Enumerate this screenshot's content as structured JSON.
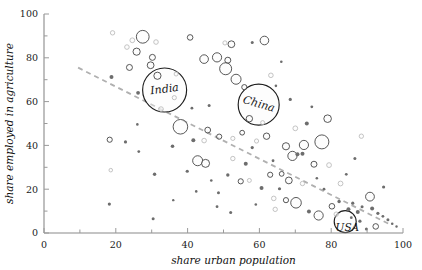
{
  "chart_data": {
    "type": "scatter",
    "title": "",
    "subtitle": "",
    "xlabel": "share urban population",
    "ylabel": "share employed in agriculture",
    "xlim": [
      0,
      100
    ],
    "ylim": [
      0,
      100
    ],
    "xticks": [
      0,
      20,
      40,
      60,
      80,
      100
    ],
    "yticks": [
      0,
      20,
      40,
      60,
      80,
      100
    ],
    "xtick_labels": [
      "0",
      "20",
      "40",
      "60",
      "80",
      "100"
    ],
    "ytick_labels": [
      "0",
      "20",
      "40",
      "60",
      "80",
      "100"
    ],
    "grid": false,
    "legend": null,
    "minor_ticks": true,
    "bubble_encoding": "population (bubble area)",
    "trend": {
      "type": "linear-fit",
      "style": "dashed",
      "color": "#b0b0b0",
      "x_start": 9.5,
      "y_start": 75.5,
      "x_end": 96.5,
      "y_end": 3.8
    },
    "annotations": [
      {
        "label": "India",
        "x": 33.7,
        "y": 65.5,
        "font_size": 11
      },
      {
        "label": "China",
        "x": 59.6,
        "y": 58.8,
        "font_size": 11
      },
      {
        "label": "USA",
        "x": 84.5,
        "y": 2.5,
        "font_size": 10.5
      }
    ],
    "points": [
      {
        "x": 33.6,
        "y": 65.3,
        "r": 22.0,
        "cls": "big",
        "name": "India"
      },
      {
        "x": 59.8,
        "y": 58.6,
        "r": 20.5,
        "cls": "big",
        "name": "China"
      },
      {
        "x": 83.9,
        "y": 5.2,
        "r": 11.0,
        "cls": "big",
        "name": "USA"
      },
      {
        "x": 19.1,
        "y": 91.4,
        "r": 2.2,
        "cls": "faint"
      },
      {
        "x": 24.6,
        "y": 88.0,
        "r": 2.4,
        "cls": "faint"
      },
      {
        "x": 27.5,
        "y": 89.6,
        "r": 6.4,
        "cls": "plain"
      },
      {
        "x": 31.2,
        "y": 87.2,
        "r": 2.3,
        "cls": "faint"
      },
      {
        "x": 23.1,
        "y": 84.9,
        "r": 2.3,
        "cls": "faint"
      },
      {
        "x": 25.8,
        "y": 82.8,
        "r": 3.6,
        "cls": "plain"
      },
      {
        "x": 30.2,
        "y": 80.2,
        "r": 3.0,
        "cls": "plain"
      },
      {
        "x": 40.7,
        "y": 89.3,
        "r": 2.8,
        "cls": "plain"
      },
      {
        "x": 50.4,
        "y": 86.8,
        "r": 2.1,
        "cls": "faint"
      },
      {
        "x": 52.2,
        "y": 86.2,
        "r": 3.4,
        "cls": "plain"
      },
      {
        "x": 58.0,
        "y": 87.0,
        "r": 1.5,
        "cls": "tiny"
      },
      {
        "x": 61.4,
        "y": 87.9,
        "r": 4.3,
        "cls": "plain"
      },
      {
        "x": 23.8,
        "y": 75.6,
        "r": 3.0,
        "cls": "plain"
      },
      {
        "x": 29.7,
        "y": 76.6,
        "r": 3.4,
        "cls": "plain"
      },
      {
        "x": 31.6,
        "y": 71.8,
        "r": 3.6,
        "cls": "plain"
      },
      {
        "x": 44.6,
        "y": 79.4,
        "r": 4.3,
        "cls": "plain"
      },
      {
        "x": 48.2,
        "y": 80.2,
        "r": 4.6,
        "cls": "plain"
      },
      {
        "x": 51.2,
        "y": 78.9,
        "r": 3.0,
        "cls": "plain"
      },
      {
        "x": 50.6,
        "y": 75.0,
        "r": 6.0,
        "cls": "plain"
      },
      {
        "x": 18.8,
        "y": 71.2,
        "r": 2.0,
        "cls": "tiny"
      },
      {
        "x": 26.2,
        "y": 64.0,
        "r": 1.9,
        "cls": "tiny"
      },
      {
        "x": 36.3,
        "y": 61.8,
        "r": 2.1,
        "cls": "faint"
      },
      {
        "x": 32.6,
        "y": 56.6,
        "r": 2.3,
        "cls": "faint"
      },
      {
        "x": 55.8,
        "y": 66.6,
        "r": 2.6,
        "cls": "plain"
      },
      {
        "x": 63.2,
        "y": 72.0,
        "r": 2.3,
        "cls": "faint"
      },
      {
        "x": 66.1,
        "y": 78.2,
        "r": 1.3,
        "cls": "tiny"
      },
      {
        "x": 53.5,
        "y": 70.2,
        "r": 5.0,
        "cls": "plain"
      },
      {
        "x": 57.2,
        "y": 52.2,
        "r": 3.2,
        "cls": "plain"
      },
      {
        "x": 60.9,
        "y": 50.4,
        "r": 2.0,
        "cls": "faint"
      },
      {
        "x": 38.0,
        "y": 48.5,
        "r": 7.3,
        "cls": "plain"
      },
      {
        "x": 45.6,
        "y": 47.0,
        "r": 2.9,
        "cls": "plain"
      },
      {
        "x": 48.8,
        "y": 44.0,
        "r": 2.6,
        "cls": "plain"
      },
      {
        "x": 42.8,
        "y": 33.0,
        "r": 5.0,
        "cls": "plain"
      },
      {
        "x": 18.3,
        "y": 42.6,
        "r": 2.6,
        "cls": "plain"
      },
      {
        "x": 22.7,
        "y": 41.6,
        "r": 1.6,
        "cls": "tiny"
      },
      {
        "x": 26.4,
        "y": 37.2,
        "r": 1.4,
        "cls": "tiny"
      },
      {
        "x": 18.6,
        "y": 28.7,
        "r": 1.8,
        "cls": "faint"
      },
      {
        "x": 18.2,
        "y": 13.2,
        "r": 1.6,
        "cls": "tiny"
      },
      {
        "x": 30.8,
        "y": 26.8,
        "r": 1.7,
        "cls": "tiny"
      },
      {
        "x": 30.4,
        "y": 6.5,
        "r": 1.5,
        "cls": "tiny"
      },
      {
        "x": 35.8,
        "y": 39.6,
        "r": 1.8,
        "cls": "tiny"
      },
      {
        "x": 41.6,
        "y": 42.4,
        "r": 2.0,
        "cls": "tiny"
      },
      {
        "x": 44.6,
        "y": 42.2,
        "r": 2.3,
        "cls": "faint"
      },
      {
        "x": 39.9,
        "y": 28.2,
        "r": 1.6,
        "cls": "tiny"
      },
      {
        "x": 52.6,
        "y": 43.2,
        "r": 2.1,
        "cls": "faint"
      },
      {
        "x": 55.2,
        "y": 45.8,
        "r": 2.4,
        "cls": "plain"
      },
      {
        "x": 59.2,
        "y": 42.0,
        "r": 2.1,
        "cls": "faint"
      },
      {
        "x": 62.0,
        "y": 44.2,
        "r": 3.2,
        "cls": "plain"
      },
      {
        "x": 58.0,
        "y": 39.0,
        "r": 1.6,
        "cls": "tiny"
      },
      {
        "x": 52.6,
        "y": 34.0,
        "r": 2.2,
        "cls": "faint"
      },
      {
        "x": 56.2,
        "y": 31.6,
        "r": 2.0,
        "cls": "tiny"
      },
      {
        "x": 51.2,
        "y": 26.5,
        "r": 1.7,
        "cls": "tiny"
      },
      {
        "x": 54.8,
        "y": 23.6,
        "r": 2.6,
        "cls": "plain"
      },
      {
        "x": 57.2,
        "y": 24.0,
        "r": 2.0,
        "cls": "faint"
      },
      {
        "x": 63.0,
        "y": 26.6,
        "r": 2.6,
        "cls": "plain"
      },
      {
        "x": 66.2,
        "y": 27.0,
        "r": 2.4,
        "cls": "plain"
      },
      {
        "x": 60.6,
        "y": 20.6,
        "r": 2.0,
        "cls": "tiny"
      },
      {
        "x": 48.6,
        "y": 18.4,
        "r": 1.5,
        "cls": "tiny"
      },
      {
        "x": 45.0,
        "y": 31.8,
        "r": 4.0,
        "cls": "plain"
      },
      {
        "x": 48.2,
        "y": 12.0,
        "r": 1.4,
        "cls": "tiny"
      },
      {
        "x": 52.0,
        "y": 9.4,
        "r": 1.5,
        "cls": "tiny"
      },
      {
        "x": 64.0,
        "y": 15.8,
        "r": 2.3,
        "cls": "faint"
      },
      {
        "x": 69.2,
        "y": 35.2,
        "r": 4.6,
        "cls": "plain"
      },
      {
        "x": 67.4,
        "y": 39.6,
        "r": 3.6,
        "cls": "plain"
      },
      {
        "x": 72.4,
        "y": 40.2,
        "r": 4.6,
        "cls": "plain"
      },
      {
        "x": 77.4,
        "y": 41.6,
        "r": 7.0,
        "cls": "plain"
      },
      {
        "x": 70.6,
        "y": 36.0,
        "r": 2.0,
        "cls": "tiny"
      },
      {
        "x": 72.0,
        "y": 36.2,
        "r": 2.0,
        "cls": "tiny"
      },
      {
        "x": 70.0,
        "y": 47.8,
        "r": 2.4,
        "cls": "faint"
      },
      {
        "x": 75.2,
        "y": 31.4,
        "r": 3.0,
        "cls": "plain"
      },
      {
        "x": 79.4,
        "y": 31.0,
        "r": 2.4,
        "cls": "faint"
      },
      {
        "x": 68.2,
        "y": 24.0,
        "r": 3.4,
        "cls": "plain"
      },
      {
        "x": 72.0,
        "y": 22.6,
        "r": 2.2,
        "cls": "faint"
      },
      {
        "x": 65.6,
        "y": 20.2,
        "r": 1.6,
        "cls": "tiny"
      },
      {
        "x": 70.2,
        "y": 13.8,
        "r": 5.3,
        "cls": "plain"
      },
      {
        "x": 67.4,
        "y": 15.0,
        "r": 2.6,
        "cls": "plain"
      },
      {
        "x": 64.4,
        "y": 10.8,
        "r": 2.2,
        "cls": "faint"
      },
      {
        "x": 73.8,
        "y": 9.8,
        "r": 2.0,
        "cls": "tiny"
      },
      {
        "x": 76.5,
        "y": 8.0,
        "r": 4.6,
        "cls": "plain"
      },
      {
        "x": 80.2,
        "y": 12.2,
        "r": 2.8,
        "cls": "plain"
      },
      {
        "x": 81.4,
        "y": 8.6,
        "r": 2.2,
        "cls": "faint"
      },
      {
        "x": 82.2,
        "y": 14.4,
        "r": 1.7,
        "cls": "tiny"
      },
      {
        "x": 84.8,
        "y": 10.8,
        "r": 2.0,
        "cls": "tiny"
      },
      {
        "x": 86.0,
        "y": 13.6,
        "r": 1.6,
        "cls": "tiny"
      },
      {
        "x": 87.4,
        "y": 9.6,
        "r": 2.0,
        "cls": "tiny"
      },
      {
        "x": 88.6,
        "y": 12.0,
        "r": 1.5,
        "cls": "tiny"
      },
      {
        "x": 85.6,
        "y": 7.0,
        "r": 1.4,
        "cls": "tiny"
      },
      {
        "x": 88.0,
        "y": 5.4,
        "r": 1.6,
        "cls": "tiny"
      },
      {
        "x": 90.8,
        "y": 16.6,
        "r": 4.4,
        "cls": "plain"
      },
      {
        "x": 91.4,
        "y": 11.2,
        "r": 2.0,
        "cls": "tiny"
      },
      {
        "x": 93.0,
        "y": 9.0,
        "r": 1.6,
        "cls": "tiny"
      },
      {
        "x": 94.4,
        "y": 7.6,
        "r": 1.4,
        "cls": "tiny"
      },
      {
        "x": 95.8,
        "y": 6.0,
        "r": 1.5,
        "cls": "tiny"
      },
      {
        "x": 97.0,
        "y": 4.2,
        "r": 1.3,
        "cls": "tiny"
      },
      {
        "x": 98.2,
        "y": 3.0,
        "r": 1.2,
        "cls": "tiny"
      },
      {
        "x": 92.4,
        "y": 3.0,
        "r": 2.8,
        "cls": "plain"
      },
      {
        "x": 89.8,
        "y": 1.8,
        "r": 1.5,
        "cls": "tiny"
      },
      {
        "x": 94.6,
        "y": 21.0,
        "r": 1.6,
        "cls": "tiny"
      },
      {
        "x": 82.6,
        "y": 22.6,
        "r": 2.4,
        "cls": "faint"
      },
      {
        "x": 84.2,
        "y": 26.8,
        "r": 1.4,
        "cls": "tiny"
      },
      {
        "x": 86.6,
        "y": 34.0,
        "r": 1.5,
        "cls": "tiny"
      },
      {
        "x": 79.0,
        "y": 52.2,
        "r": 3.8,
        "cls": "plain"
      },
      {
        "x": 74.6,
        "y": 57.6,
        "r": 1.4,
        "cls": "tiny"
      },
      {
        "x": 68.6,
        "y": 61.0,
        "r": 1.6,
        "cls": "tiny"
      },
      {
        "x": 88.4,
        "y": 44.2,
        "r": 2.2,
        "cls": "faint"
      },
      {
        "x": 73.2,
        "y": 50.0,
        "r": 2.0,
        "cls": "tiny"
      },
      {
        "x": 46.0,
        "y": 58.2,
        "r": 1.5,
        "cls": "tiny"
      },
      {
        "x": 41.2,
        "y": 57.0,
        "r": 1.4,
        "cls": "tiny"
      },
      {
        "x": 36.8,
        "y": 72.6,
        "r": 2.0,
        "cls": "faint"
      },
      {
        "x": 64.6,
        "y": 67.2,
        "r": 1.3,
        "cls": "tiny"
      },
      {
        "x": 42.4,
        "y": 19.0,
        "r": 1.3,
        "cls": "tiny"
      },
      {
        "x": 59.0,
        "y": 13.0,
        "r": 1.3,
        "cls": "tiny"
      },
      {
        "x": 36.0,
        "y": 15.0,
        "r": 1.2,
        "cls": "tiny"
      },
      {
        "x": 26.0,
        "y": 49.6,
        "r": 1.3,
        "cls": "tiny"
      },
      {
        "x": 63.8,
        "y": 33.0,
        "r": 1.4,
        "cls": "tiny"
      },
      {
        "x": 46.6,
        "y": 24.0,
        "r": 1.3,
        "cls": "tiny"
      },
      {
        "x": 78.0,
        "y": 20.0,
        "r": 1.4,
        "cls": "tiny"
      },
      {
        "x": 76.0,
        "y": 25.0,
        "r": 1.3,
        "cls": "tiny"
      }
    ]
  }
}
